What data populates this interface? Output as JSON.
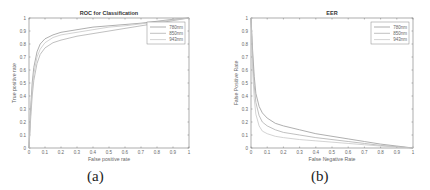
{
  "captions": {
    "a": "(a)",
    "b": "(b)"
  },
  "chart_data": [
    {
      "id": "a",
      "type": "line",
      "title": "ROC for Classification",
      "xlabel": "False positive rate",
      "ylabel": "True positive rate",
      "xlim": [
        0,
        1
      ],
      "ylim": [
        0,
        1
      ],
      "xticks": [
        "0",
        "0.1",
        "0.2",
        "0.3",
        "0.4",
        "0.5",
        "0.6",
        "0.7",
        "0.8",
        "0.9",
        "1"
      ],
      "yticks": [
        "0",
        "0.1",
        "0.2",
        "0.3",
        "0.4",
        "0.5",
        "0.6",
        "0.7",
        "0.8",
        "0.9",
        "1"
      ],
      "grid": false,
      "legend_position": "upper right",
      "series": [
        {
          "name": "780nm",
          "color": "#9a9a9a",
          "x": [
            0,
            0.01,
            0.02,
            0.03,
            0.05,
            0.07,
            0.1,
            0.15,
            0.2,
            0.3,
            0.4,
            0.5,
            0.6,
            0.7,
            0.8,
            0.9,
            1.0
          ],
          "y": [
            0,
            0.3,
            0.5,
            0.62,
            0.74,
            0.8,
            0.84,
            0.87,
            0.89,
            0.91,
            0.93,
            0.94,
            0.95,
            0.96,
            0.975,
            0.99,
            1.0
          ]
        },
        {
          "name": "850nm",
          "color": "#b0b0b0",
          "x": [
            0,
            0.01,
            0.02,
            0.03,
            0.05,
            0.07,
            0.1,
            0.15,
            0.2,
            0.3,
            0.4,
            0.5,
            0.6,
            0.7,
            0.8,
            0.9,
            1.0
          ],
          "y": [
            0,
            0.22,
            0.4,
            0.52,
            0.65,
            0.72,
            0.77,
            0.81,
            0.83,
            0.86,
            0.88,
            0.9,
            0.92,
            0.94,
            0.96,
            0.98,
            1.0
          ]
        },
        {
          "name": "943nm",
          "color": "#c8c8c8",
          "x": [
            0,
            0.01,
            0.02,
            0.03,
            0.05,
            0.07,
            0.1,
            0.15,
            0.2,
            0.3,
            0.4,
            0.5,
            0.6,
            0.7,
            0.8,
            0.9,
            1.0
          ],
          "y": [
            0,
            0.26,
            0.45,
            0.57,
            0.7,
            0.76,
            0.81,
            0.85,
            0.87,
            0.89,
            0.91,
            0.93,
            0.94,
            0.955,
            0.97,
            0.985,
            1.0
          ]
        }
      ]
    },
    {
      "id": "b",
      "type": "line",
      "title": "EER",
      "xlabel": "False Negative Rate",
      "ylabel": "False Positive Rate",
      "xlim": [
        0,
        1
      ],
      "ylim": [
        0,
        1
      ],
      "xticks": [
        "0",
        "0.1",
        "0.2",
        "0.3",
        "0.4",
        "0.5",
        "0.6",
        "0.7",
        "0.8",
        "0.9",
        "1"
      ],
      "yticks": [
        "0",
        "0.1",
        "0.2",
        "0.3",
        "0.4",
        "0.5",
        "0.6",
        "0.7",
        "0.8",
        "0.9",
        "1"
      ],
      "grid": false,
      "legend_position": "upper right",
      "series": [
        {
          "name": "780nm",
          "color": "#9a9a9a",
          "x": [
            0,
            0.01,
            0.02,
            0.03,
            0.05,
            0.07,
            0.1,
            0.15,
            0.2,
            0.3,
            0.4,
            0.5,
            0.6,
            0.7,
            0.8,
            0.9,
            1.0
          ],
          "y": [
            1.0,
            0.75,
            0.55,
            0.42,
            0.32,
            0.27,
            0.23,
            0.19,
            0.17,
            0.14,
            0.11,
            0.09,
            0.07,
            0.05,
            0.03,
            0.015,
            0
          ]
        },
        {
          "name": "850nm",
          "color": "#b0b0b0",
          "x": [
            0,
            0.01,
            0.02,
            0.03,
            0.05,
            0.07,
            0.1,
            0.15,
            0.2,
            0.3,
            0.4,
            0.5,
            0.6,
            0.7,
            0.8,
            0.9,
            1.0
          ],
          "y": [
            1.0,
            0.7,
            0.48,
            0.35,
            0.25,
            0.2,
            0.17,
            0.14,
            0.12,
            0.1,
            0.08,
            0.065,
            0.05,
            0.035,
            0.02,
            0.01,
            0
          ]
        },
        {
          "name": "943nm",
          "color": "#c8c8c8",
          "x": [
            0,
            0.01,
            0.02,
            0.03,
            0.05,
            0.07,
            0.1,
            0.15,
            0.2,
            0.3,
            0.4,
            0.5,
            0.6,
            0.7,
            0.8,
            0.9,
            1.0
          ],
          "y": [
            1.0,
            0.6,
            0.38,
            0.26,
            0.17,
            0.13,
            0.11,
            0.09,
            0.08,
            0.065,
            0.055,
            0.045,
            0.035,
            0.025,
            0.015,
            0.008,
            0
          ]
        }
      ]
    }
  ]
}
